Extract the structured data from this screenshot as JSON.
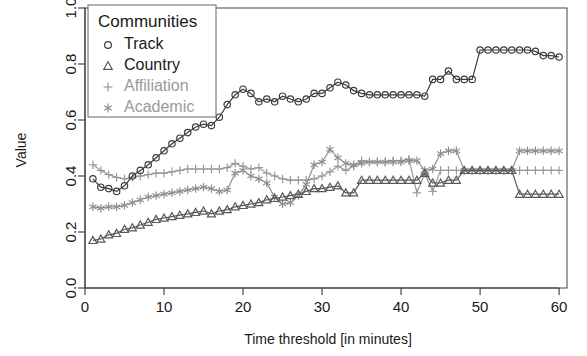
{
  "chart_data": {
    "type": "line",
    "title": "",
    "xlabel": "Time threshold [in minutes]",
    "ylabel": "Value",
    "xlim": [
      0,
      61
    ],
    "ylim": [
      0.0,
      1.0
    ],
    "xticks": [
      0,
      10,
      20,
      30,
      40,
      50,
      60
    ],
    "xtick_labels": [
      "0",
      "10",
      "20",
      "30",
      "40",
      "50",
      "60"
    ],
    "yticks": [
      0.0,
      0.2,
      0.4,
      0.6,
      0.8,
      1.0
    ],
    "ytick_labels": [
      "0.0",
      "0.2",
      "0.4",
      "0.6",
      "0.8",
      "1.0"
    ],
    "grid": false,
    "legend_position": "top-left",
    "legend_title": "Communities",
    "x": [
      1,
      2,
      3,
      4,
      5,
      6,
      7,
      8,
      9,
      10,
      11,
      12,
      13,
      14,
      15,
      16,
      17,
      18,
      19,
      20,
      21,
      22,
      23,
      24,
      25,
      26,
      27,
      28,
      29,
      30,
      31,
      32,
      33,
      34,
      35,
      36,
      37,
      38,
      39,
      40,
      41,
      42,
      43,
      44,
      45,
      46,
      47,
      48,
      49,
      50,
      51,
      52,
      53,
      54,
      55,
      56,
      57,
      58,
      59,
      60
    ],
    "series": [
      {
        "name": "Track",
        "marker": "circle",
        "color": "#3d3d3d",
        "values": [
          0.39,
          0.36,
          0.355,
          0.345,
          0.365,
          0.4,
          0.42,
          0.44,
          0.465,
          0.49,
          0.515,
          0.535,
          0.555,
          0.575,
          0.585,
          0.58,
          0.61,
          0.655,
          0.69,
          0.71,
          0.695,
          0.665,
          0.675,
          0.665,
          0.685,
          0.675,
          0.665,
          0.675,
          0.695,
          0.695,
          0.715,
          0.735,
          0.725,
          0.705,
          0.695,
          0.69,
          0.69,
          0.69,
          0.69,
          0.69,
          0.69,
          0.69,
          0.685,
          0.745,
          0.745,
          0.775,
          0.745,
          0.745,
          0.745,
          0.85,
          0.85,
          0.85,
          0.85,
          0.85,
          0.85,
          0.85,
          0.845,
          0.83,
          0.83,
          0.825
        ]
      },
      {
        "name": "Country",
        "marker": "triangle",
        "color": "#595959",
        "values": [
          0.17,
          0.175,
          0.19,
          0.195,
          0.21,
          0.215,
          0.225,
          0.235,
          0.245,
          0.25,
          0.255,
          0.26,
          0.265,
          0.27,
          0.275,
          0.265,
          0.275,
          0.28,
          0.29,
          0.295,
          0.3,
          0.305,
          0.315,
          0.32,
          0.325,
          0.33,
          0.335,
          0.345,
          0.355,
          0.355,
          0.36,
          0.365,
          0.34,
          0.34,
          0.385,
          0.385,
          0.385,
          0.385,
          0.385,
          0.385,
          0.385,
          0.385,
          0.41,
          0.375,
          0.375,
          0.385,
          0.385,
          0.42,
          0.42,
          0.42,
          0.42,
          0.42,
          0.42,
          0.42,
          0.335,
          0.335,
          0.335,
          0.335,
          0.335,
          0.335
        ]
      },
      {
        "name": "Affiliation",
        "marker": "plus",
        "color": "#9a9a9a",
        "values": [
          0.44,
          0.42,
          0.405,
          0.395,
          0.39,
          0.395,
          0.4,
          0.405,
          0.41,
          0.41,
          0.415,
          0.42,
          0.425,
          0.425,
          0.425,
          0.425,
          0.425,
          0.43,
          0.445,
          0.435,
          0.425,
          0.43,
          0.41,
          0.4,
          0.39,
          0.385,
          0.385,
          0.385,
          0.39,
          0.4,
          0.415,
          0.435,
          0.42,
          0.435,
          0.455,
          0.45,
          0.45,
          0.45,
          0.455,
          0.455,
          0.46,
          0.34,
          0.41,
          0.345,
          0.42,
          0.42,
          0.42,
          0.42,
          0.42,
          0.42,
          0.42,
          0.42,
          0.42,
          0.42,
          0.42,
          0.42,
          0.42,
          0.42,
          0.42,
          0.42
        ]
      },
      {
        "name": "Academic",
        "marker": "asterisk",
        "color": "#8f8f8f",
        "values": [
          0.29,
          0.285,
          0.29,
          0.29,
          0.295,
          0.305,
          0.315,
          0.325,
          0.33,
          0.335,
          0.34,
          0.345,
          0.35,
          0.355,
          0.36,
          0.355,
          0.345,
          0.35,
          0.41,
          0.42,
          0.4,
          0.39,
          0.375,
          0.325,
          0.3,
          0.305,
          0.33,
          0.37,
          0.44,
          0.45,
          0.495,
          0.465,
          0.445,
          0.44,
          0.445,
          0.45,
          0.45,
          0.45,
          0.45,
          0.45,
          0.455,
          0.455,
          0.42,
          0.425,
          0.48,
          0.49,
          0.49,
          0.42,
          0.42,
          0.42,
          0.42,
          0.42,
          0.42,
          0.42,
          0.49,
          0.49,
          0.49,
          0.49,
          0.49,
          0.49
        ]
      }
    ]
  },
  "legend": {
    "title": "Communities",
    "items": [
      {
        "label": "Track",
        "marker": "circle-marker-icon"
      },
      {
        "label": "Country",
        "marker": "triangle-marker-icon"
      },
      {
        "label": "Affiliation",
        "marker": "plus-marker-icon"
      },
      {
        "label": "Academic",
        "marker": "asterisk-marker-icon"
      }
    ]
  },
  "axes": {
    "y_title": "Value",
    "x_title": "Time threshold [in minutes]"
  }
}
